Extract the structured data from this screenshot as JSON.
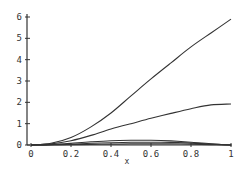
{
  "chart_data": {
    "type": "line",
    "title": "",
    "xlabel": "x",
    "ylabel": "",
    "xlim": [
      0,
      1
    ],
    "ylim": [
      0,
      6
    ],
    "grid": false,
    "legend": null,
    "xticks": [
      "0",
      "0.2",
      "0.4",
      "0.6",
      "0.8",
      "1"
    ],
    "yticks": [
      "0",
      "1",
      "2",
      "3",
      "4",
      "5",
      "6"
    ],
    "x": [
      0,
      0.1,
      0.2,
      0.3,
      0.4,
      0.5,
      0.6,
      0.7,
      0.8,
      0.9,
      1.0
    ],
    "series": [
      {
        "name": "curve-1",
        "values": [
          0,
          0.08,
          0.35,
          0.85,
          1.5,
          2.3,
          3.1,
          3.85,
          4.6,
          5.25,
          5.9
        ]
      },
      {
        "name": "curve-2",
        "values": [
          0,
          0.05,
          0.2,
          0.45,
          0.75,
          1.0,
          1.25,
          1.48,
          1.7,
          1.88,
          1.92
        ]
      },
      {
        "name": "curve-3",
        "values": [
          0,
          0.02,
          0.08,
          0.15,
          0.2,
          0.22,
          0.22,
          0.19,
          0.13,
          0.06,
          0
        ]
      },
      {
        "name": "curve-4",
        "values": [
          0,
          0.01,
          0.04,
          0.08,
          0.11,
          0.13,
          0.13,
          0.12,
          0.09,
          0.04,
          0
        ]
      },
      {
        "name": "curve-5",
        "values": [
          0,
          0.01,
          0.02,
          0.03,
          0.04,
          0.05,
          0.05,
          0.05,
          0.04,
          0.02,
          0
        ]
      }
    ]
  },
  "colors": {
    "line": "#333333",
    "axis": "#333333",
    "background": "#ffffff"
  }
}
